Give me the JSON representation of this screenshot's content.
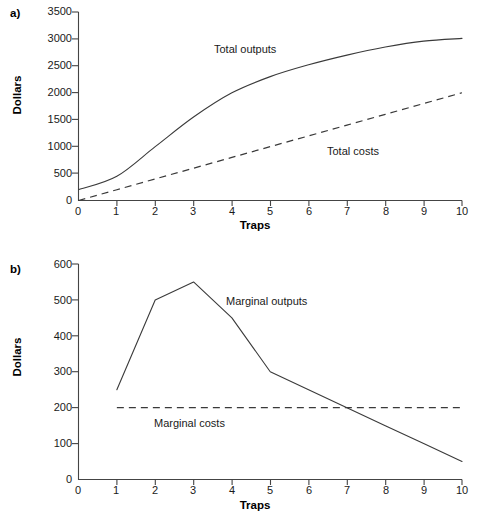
{
  "figure": {
    "panels": [
      {
        "tag": "a)",
        "xlabel": "Traps",
        "ylabel": "Dollars",
        "yticks": [
          "0",
          "500",
          "1000",
          "1500",
          "2000",
          "2500",
          "3000",
          "3500"
        ],
        "xticks": [
          "0",
          "1",
          "2",
          "3",
          "4",
          "5",
          "6",
          "7",
          "8",
          "9",
          "10"
        ],
        "series_labels": [
          "Total outputs",
          "Total costs"
        ]
      },
      {
        "tag": "b)",
        "xlabel": "Traps",
        "ylabel": "Dollars",
        "yticks": [
          "0",
          "100",
          "200",
          "300",
          "400",
          "500",
          "600"
        ],
        "xticks": [
          "0",
          "1",
          "2",
          "3",
          "4",
          "5",
          "6",
          "7",
          "8",
          "9",
          "10"
        ],
        "series_labels": [
          "Marginal outputs",
          "Marginal costs"
        ]
      }
    ]
  },
  "chart_data": [
    {
      "type": "line",
      "panel": "a)",
      "title": "",
      "xlabel": "Traps",
      "ylabel": "Dollars",
      "xlim": [
        0,
        10
      ],
      "ylim": [
        0,
        3500
      ],
      "xticks": [
        0,
        1,
        2,
        3,
        4,
        5,
        6,
        7,
        8,
        9,
        10
      ],
      "yticks": [
        0,
        500,
        1000,
        1500,
        2000,
        2500,
        3000,
        3500
      ],
      "grid": false,
      "legend": "inline-annotation",
      "series": [
        {
          "name": "Total outputs",
          "style": "solid",
          "x": [
            0,
            1,
            2,
            3,
            4,
            5,
            6,
            7,
            8,
            9,
            10
          ],
          "values": [
            200,
            450,
            1000,
            1550,
            2000,
            2300,
            2520,
            2700,
            2850,
            2960,
            3010
          ]
        },
        {
          "name": "Total costs",
          "style": "dashed",
          "x": [
            0,
            1,
            2,
            3,
            4,
            5,
            6,
            7,
            8,
            9,
            10
          ],
          "values": [
            0,
            200,
            400,
            600,
            800,
            1000,
            1200,
            1400,
            1600,
            1800,
            2000
          ]
        }
      ]
    },
    {
      "type": "line",
      "panel": "b)",
      "title": "",
      "xlabel": "Traps",
      "ylabel": "Dollars",
      "xlim": [
        0,
        10
      ],
      "ylim": [
        0,
        600
      ],
      "xticks": [
        0,
        1,
        2,
        3,
        4,
        5,
        6,
        7,
        8,
        9,
        10
      ],
      "yticks": [
        0,
        100,
        200,
        300,
        400,
        500,
        600
      ],
      "grid": false,
      "legend": "inline-annotation",
      "series": [
        {
          "name": "Marginal outputs",
          "style": "solid",
          "x": [
            1,
            2,
            3,
            4,
            5,
            6,
            7,
            8,
            9,
            10
          ],
          "values": [
            250,
            500,
            550,
            450,
            300,
            250,
            200,
            150,
            100,
            50
          ]
        },
        {
          "name": "Marginal costs",
          "style": "dashed",
          "x": [
            1,
            10
          ],
          "values": [
            200,
            200
          ]
        }
      ]
    }
  ],
  "colors": {
    "line": "#3a3a3a",
    "axis": "#444444",
    "text": "#1a1a1a",
    "background": "#ffffff"
  }
}
